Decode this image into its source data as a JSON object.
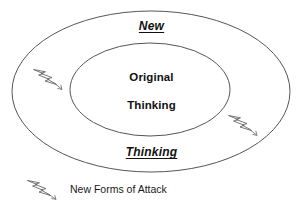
{
  "diagram": {
    "type": "concentric-ellipse",
    "background_color": "#ffffff",
    "line_color": "#555555",
    "text_color": "#111111",
    "outer_ring": {
      "label_top": "New",
      "label_bottom": "Thinking"
    },
    "inner_ring": {
      "label_line_1": "Original",
      "label_line_2": "Thinking"
    },
    "attack_markers": [
      {
        "name": "attack-bolt-left",
        "position": "outer-ring-left"
      },
      {
        "name": "attack-bolt-right",
        "position": "outer-ring-right"
      }
    ]
  },
  "legend": {
    "icon": "lightning-bolt-icon",
    "label": "New Forms of Attack"
  }
}
